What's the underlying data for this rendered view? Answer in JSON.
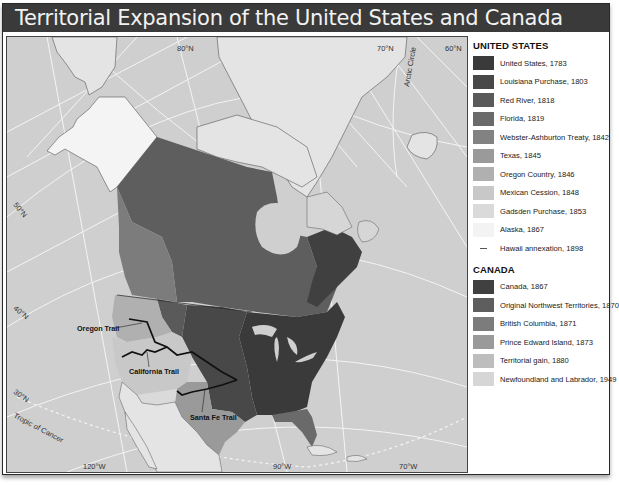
{
  "title": "Territorial Expansion of the United States and Canada",
  "colors": {
    "ocean": "#cfcfcf",
    "land_other": "#e4e4e4",
    "title_bg": "#3a3a3a",
    "grid": "#f4f4f4",
    "trail": "#111111"
  },
  "map": {
    "graticule_labels": [
      {
        "id": "lat-80n",
        "text": "80°N"
      },
      {
        "id": "lat-70n",
        "text": "70°N"
      },
      {
        "id": "lat-60n",
        "text": "60°N"
      },
      {
        "id": "lat-50n",
        "text": "50°N"
      },
      {
        "id": "lat-40n",
        "text": "40°N"
      },
      {
        "id": "lat-30n",
        "text": "30°N"
      },
      {
        "id": "lon-120w",
        "text": "120°W"
      },
      {
        "id": "lon-90w",
        "text": "90°W"
      },
      {
        "id": "lon-70w",
        "text": "70°W"
      },
      {
        "id": "arctic-circle",
        "text": "Arctic Circle"
      },
      {
        "id": "tropic-of-cancer",
        "text": "Tropic of Cancer"
      }
    ],
    "trails": [
      {
        "id": "oregon-trail",
        "label": "Oregon Trail"
      },
      {
        "id": "california-trail",
        "label": "California Trail"
      },
      {
        "id": "santa-fe-trail",
        "label": "Santa Fe Trail"
      }
    ]
  },
  "legend": {
    "us_heading": "UNITED STATES",
    "us_items": [
      {
        "label": "United States, 1783",
        "color": "#3a3a3a",
        "type": "swatch"
      },
      {
        "label": "Louisiana Purchase, 1803",
        "color": "#484848",
        "type": "swatch"
      },
      {
        "label": "Red River, 1818",
        "color": "#5a5a5a",
        "type": "swatch"
      },
      {
        "label": "Florida, 1819",
        "color": "#6a6a6a",
        "type": "swatch"
      },
      {
        "label": "Webster-Ashburton Treaty, 1842",
        "color": "#828282",
        "type": "swatch"
      },
      {
        "label": "Texas, 1845",
        "color": "#9a9a9a",
        "type": "swatch"
      },
      {
        "label": "Oregon Country, 1846",
        "color": "#b0b0b0",
        "type": "swatch"
      },
      {
        "label": "Mexican Cession, 1848",
        "color": "#c8c8c8",
        "type": "swatch"
      },
      {
        "label": "Gadsden Purchase, 1853",
        "color": "#dadada",
        "type": "swatch"
      },
      {
        "label": "Alaska, 1867",
        "color": "#f3f3f3",
        "type": "swatch"
      },
      {
        "label": "Hawaii annexation, 1898",
        "color": "#555555",
        "type": "line"
      }
    ],
    "canada_heading": "CANADA",
    "canada_items": [
      {
        "label": "Canada, 1867",
        "color": "#404040",
        "type": "swatch"
      },
      {
        "label": "Original Northwest Territories, 1870",
        "color": "#5e5e5e",
        "type": "swatch"
      },
      {
        "label": "British Columbia, 1871",
        "color": "#7c7c7c",
        "type": "swatch"
      },
      {
        "label": "Prince Edward Island, 1873",
        "color": "#9a9a9a",
        "type": "swatch"
      },
      {
        "label": "Territorial gain, 1880",
        "color": "#bdbdbd",
        "type": "swatch"
      },
      {
        "label": "Newfoundland and Labrador, 1949",
        "color": "#d6d6d6",
        "type": "swatch"
      }
    ]
  }
}
